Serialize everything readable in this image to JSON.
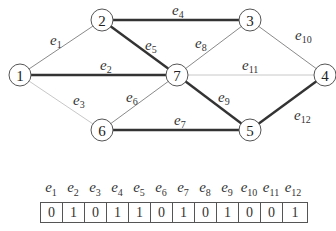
{
  "graph": {
    "nodes": [
      {
        "id": "1",
        "x": 20,
        "y": 75
      },
      {
        "id": "2",
        "x": 102,
        "y": 20
      },
      {
        "id": "3",
        "x": 250,
        "y": 20
      },
      {
        "id": "4",
        "x": 325,
        "y": 75
      },
      {
        "id": "5",
        "x": 250,
        "y": 130
      },
      {
        "id": "6",
        "x": 102,
        "y": 130
      },
      {
        "id": "7",
        "x": 177,
        "y": 75
      }
    ],
    "edges": [
      {
        "name": "e",
        "sub": "1",
        "from": "1",
        "to": "2",
        "selected": 0,
        "lx": 50,
        "ly": 45
      },
      {
        "name": "e",
        "sub": "2",
        "from": "1",
        "to": "7",
        "selected": 1,
        "lx": 100,
        "ly": 70
      },
      {
        "name": "e",
        "sub": "3",
        "from": "1",
        "to": "6",
        "selected": 0,
        "lx": 73,
        "ly": 105
      },
      {
        "name": "e",
        "sub": "4",
        "from": "2",
        "to": "3",
        "selected": 1,
        "lx": 172,
        "ly": 15
      },
      {
        "name": "e",
        "sub": "5",
        "from": "2",
        "to": "7",
        "selected": 1,
        "lx": 145,
        "ly": 50
      },
      {
        "name": "e",
        "sub": "6",
        "from": "6",
        "to": "7",
        "selected": 0,
        "lx": 126,
        "ly": 102
      },
      {
        "name": "e",
        "sub": "7",
        "from": "6",
        "to": "5",
        "selected": 1,
        "lx": 174,
        "ly": 125
      },
      {
        "name": "e",
        "sub": "8",
        "from": "7",
        "to": "3",
        "selected": 0,
        "lx": 195,
        "ly": 48
      },
      {
        "name": "e",
        "sub": "9",
        "from": "7",
        "to": "5",
        "selected": 1,
        "lx": 218,
        "ly": 102
      },
      {
        "name": "e",
        "sub": "10",
        "from": "3",
        "to": "4",
        "selected": 0,
        "lx": 295,
        "ly": 40
      },
      {
        "name": "e",
        "sub": "11",
        "from": "7",
        "to": "4",
        "selected": 0,
        "lx": 242,
        "ly": 70
      },
      {
        "name": "e",
        "sub": "12",
        "from": "5",
        "to": "4",
        "selected": 1,
        "lx": 294,
        "ly": 120
      }
    ]
  },
  "table": {
    "headers": [
      {
        "name": "e",
        "sub": "1"
      },
      {
        "name": "e",
        "sub": "2"
      },
      {
        "name": "e",
        "sub": "3"
      },
      {
        "name": "e",
        "sub": "4"
      },
      {
        "name": "e",
        "sub": "5"
      },
      {
        "name": "e",
        "sub": "6"
      },
      {
        "name": "e",
        "sub": "7"
      },
      {
        "name": "e",
        "sub": "8"
      },
      {
        "name": "e",
        "sub": "9"
      },
      {
        "name": "e",
        "sub": "10"
      },
      {
        "name": "e",
        "sub": "11"
      },
      {
        "name": "e",
        "sub": "12"
      }
    ],
    "values": [
      "0",
      "1",
      "0",
      "1",
      "1",
      "0",
      "1",
      "0",
      "1",
      "0",
      "0",
      "1"
    ]
  },
  "colors": {
    "thick_edge": "#333333",
    "thin_edge": "#8a8a8a",
    "faint_edge": "#c8c8c8",
    "node_stroke": "#555555"
  }
}
